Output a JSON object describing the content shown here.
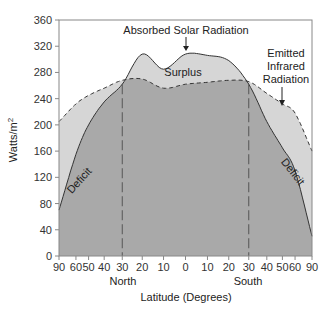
{
  "chart_data": {
    "type": "area",
    "title": "",
    "xlabel": "Latitude (Degrees)",
    "ylabel": "Watts/m²",
    "ylim": [
      0,
      360
    ],
    "yticks": [
      0,
      40,
      80,
      120,
      160,
      200,
      240,
      280,
      320,
      360
    ],
    "x_scale": "sine of latitude (area-weighted)",
    "xtick_labels": [
      "90",
      "60",
      "50",
      "40",
      "30",
      "20",
      "10",
      "0",
      "10",
      "20",
      "30",
      "40",
      "50",
      "60",
      "90"
    ],
    "xtick_lats": [
      90,
      60,
      50,
      40,
      30,
      20,
      10,
      0,
      -10,
      -20,
      -30,
      -40,
      -50,
      -60,
      -90
    ],
    "hemisphere_labels": {
      "north": "North",
      "south": "South"
    },
    "x": [
      90,
      60,
      50,
      40,
      30,
      20,
      10,
      0,
      -10,
      -20,
      -30,
      -40,
      -50,
      -60,
      -90
    ],
    "series": [
      {
        "name": "Absorbed Solar Radiation",
        "style": "solid",
        "values": [
          70,
          155,
          200,
          235,
          262,
          308,
          285,
          308,
          306,
          298,
          262,
          205,
          165,
          130,
          30
        ]
      },
      {
        "name": "Emitted Infrared Radiation",
        "style": "dashed",
        "values": [
          205,
          232,
          245,
          256,
          268,
          270,
          256,
          262,
          265,
          268,
          266,
          248,
          232,
          218,
          160
        ]
      }
    ],
    "regions": [
      {
        "label": "Surplus",
        "range_lat": [
          30,
          -30
        ]
      },
      {
        "label": "Deficit",
        "range_lat": [
          90,
          30
        ]
      },
      {
        "label": "Deficit",
        "range_lat": [
          -30,
          -90
        ]
      }
    ],
    "vertical_dashed_lines_lat": [
      30,
      -30
    ],
    "grid": false,
    "legend": "none (inline annotations)"
  },
  "labels": {
    "absorbed": "Absorbed Solar Radiation",
    "emitted_1": "Emitted",
    "emitted_2": "Infrared",
    "emitted_3": "Radiation",
    "surplus": "Surplus",
    "deficit_left": "Deficit",
    "deficit_right": "Deficit",
    "ylabel_main": "Watts/m",
    "ylabel_sup": "2",
    "xlabel": "Latitude (Degrees)",
    "north": "North",
    "south": "South"
  },
  "colors": {
    "below_both": "#a9a9a9",
    "between": "#d6d6d6",
    "line": "#333333",
    "axis": "#888888"
  }
}
